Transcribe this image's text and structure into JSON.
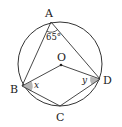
{
  "diagram": {
    "colors": {
      "stroke": "#333333",
      "angle_fill": "#b5b5b5",
      "background": "#ffffff"
    },
    "circle": {
      "cx": 60,
      "cy": 64,
      "r": 42
    },
    "points": {
      "A": {
        "label": "A",
        "x": 51,
        "y": 22
      },
      "B": {
        "label": "B",
        "x": 22,
        "y": 86
      },
      "C": {
        "label": "C",
        "x": 60,
        "y": 106
      },
      "D": {
        "label": "D",
        "x": 100,
        "y": 79
      },
      "O": {
        "label": "O",
        "x": 61,
        "y": 65
      }
    },
    "segments": [
      "AB",
      "AD",
      "BC",
      "CD",
      "OB",
      "OD"
    ],
    "angles": {
      "A": {
        "label": "65°"
      },
      "B": {
        "label": "x"
      },
      "D": {
        "label": "y"
      }
    }
  }
}
